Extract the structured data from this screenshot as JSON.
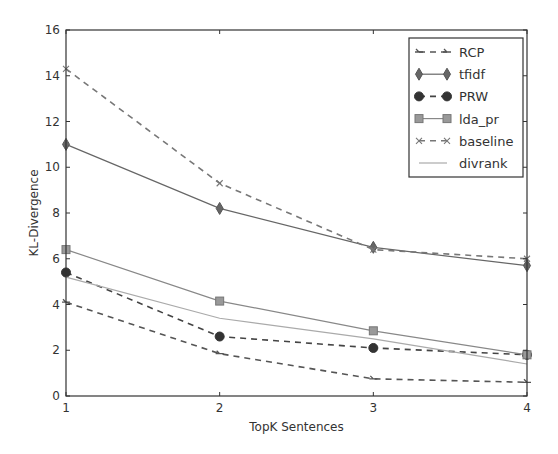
{
  "chart_data": {
    "type": "line",
    "title": "",
    "xlabel": "TopK Sentences",
    "ylabel": "KL-Divergence",
    "x": [
      1,
      2,
      3,
      4
    ],
    "xlim": [
      1,
      4
    ],
    "ylim": [
      0,
      16
    ],
    "xticks": [
      "1",
      "2",
      "3",
      "4"
    ],
    "yticks": [
      "0",
      "2",
      "4",
      "6",
      "8",
      "10",
      "12",
      "14",
      "16"
    ],
    "grid": false,
    "legend_position": "top-right",
    "series": [
      {
        "name": "RCP",
        "values": [
          4.1,
          1.85,
          0.75,
          0.6
        ],
        "linestyle": "dashed",
        "marker": "tri",
        "color": "#555555"
      },
      {
        "name": "tfidf",
        "values": [
          11.0,
          8.2,
          6.5,
          5.7
        ],
        "linestyle": "solid",
        "marker": "diamond",
        "color": "#666666"
      },
      {
        "name": "PRW",
        "values": [
          5.4,
          2.6,
          2.1,
          1.8
        ],
        "linestyle": "dashed",
        "marker": "circle",
        "color": "#444444"
      },
      {
        "name": "lda_pr",
        "values": [
          6.4,
          4.15,
          2.85,
          1.8
        ],
        "linestyle": "solid",
        "marker": "square",
        "color": "#888888"
      },
      {
        "name": "baseline",
        "values": [
          14.3,
          9.3,
          6.4,
          6.0
        ],
        "linestyle": "dashed",
        "marker": "x",
        "color": "#777777"
      },
      {
        "name": "divrank",
        "values": [
          5.2,
          3.4,
          2.5,
          1.4
        ],
        "linestyle": "solid",
        "marker": "none",
        "color": "#aaaaaa"
      }
    ]
  }
}
